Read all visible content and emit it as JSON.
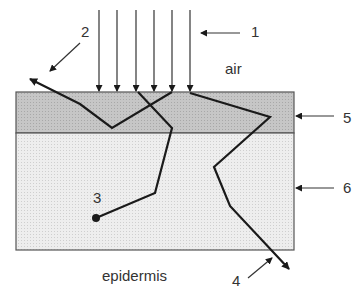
{
  "diagram": {
    "labels": {
      "n1": "1",
      "n2": "2",
      "n3": "3",
      "n4": "4",
      "n5": "5",
      "n6": "6",
      "air": "air",
      "epidermis": "epidermis"
    },
    "colors": {
      "top_layer": "#c8c8c8",
      "bottom_layer": "#ebebeb",
      "line": "#1a1a1a",
      "outline": "#555555"
    }
  }
}
